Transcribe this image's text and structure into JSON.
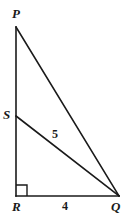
{
  "figure": {
    "kind": "right-triangle-with-cevian",
    "background_color": "#ffffff",
    "stroke_color": "#1a1a1a",
    "stroke_width": 1.6,
    "vertices": {
      "P": {
        "label": "P",
        "x": 16,
        "y": 27
      },
      "S": {
        "label": "S",
        "x": 16,
        "y": 116
      },
      "R": {
        "label": "R",
        "x": 16,
        "y": 196
      },
      "Q": {
        "label": "Q",
        "x": 119,
        "y": 196
      }
    },
    "segments": [
      {
        "name": "PR",
        "from": "P",
        "to": "R"
      },
      {
        "name": "PQ",
        "from": "P",
        "to": "Q"
      },
      {
        "name": "SQ",
        "from": "S",
        "to": "Q"
      },
      {
        "name": "RQ",
        "from": "R",
        "to": "Q"
      }
    ],
    "right_angle": {
      "at": "R",
      "size": 10
    },
    "measures": {
      "SQ": "5",
      "RQ": "4"
    }
  }
}
